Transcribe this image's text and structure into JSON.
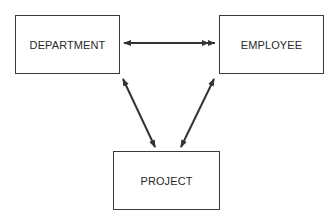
{
  "diagram": {
    "type": "entity-relationship",
    "entities": [
      {
        "id": "department",
        "label": "DEPARTMENT"
      },
      {
        "id": "employee",
        "label": "EMPLOYEE"
      },
      {
        "id": "project",
        "label": "PROJECT"
      }
    ],
    "relationships": [
      {
        "from": "department",
        "to": "employee",
        "from_end": "single-arrow",
        "to_end": "double-arrow"
      },
      {
        "from": "department",
        "to": "project",
        "from_end": "single-arrow",
        "to_end": "single-arrow"
      },
      {
        "from": "employee",
        "to": "project",
        "from_end": "single-arrow",
        "to_end": "single-arrow"
      }
    ],
    "colors": {
      "line": "#333333",
      "box_border": "#3a3a3a",
      "text": "#2a2a2a",
      "background": "#ffffff"
    }
  }
}
